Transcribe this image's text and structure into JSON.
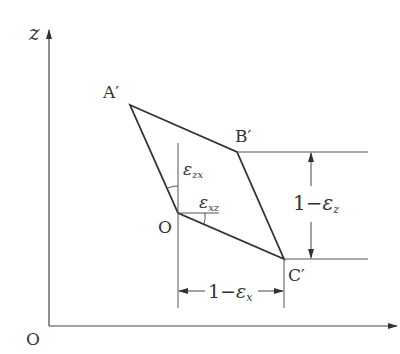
{
  "diagram": {
    "axes": {
      "vertical_label": "z",
      "origin_label": "O",
      "horizontal_label": ""
    },
    "points": {
      "A": "A′",
      "B": "B′",
      "C": "C′",
      "O": "O"
    },
    "angles": {
      "zx": "ε",
      "zx_sub": "zx",
      "xz": "ε",
      "xz_sub": "xz"
    },
    "dimensions": {
      "vertical": {
        "one": "1",
        "minus": "−",
        "eps": "ε",
        "sub": "z"
      },
      "horizontal": {
        "one": "1",
        "minus": "−",
        "eps": "ε",
        "sub": "x"
      }
    },
    "colors": {
      "stroke": "#333333",
      "thin": "#555555"
    }
  }
}
